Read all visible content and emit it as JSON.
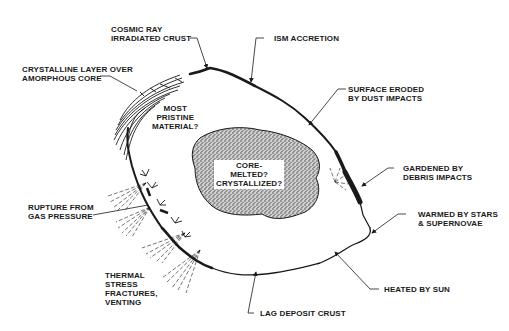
{
  "diagram": {
    "labels": {
      "cosmic_ray": [
        "COSMIC RAY",
        "IRRADIATED CRUST"
      ],
      "ism_accretion": [
        "ISM ACCRETION"
      ],
      "crystalline_layer": [
        "CRYSTALLINE LAYER OVER",
        "AMORPHOUS CORE"
      ],
      "surface_eroded": [
        "SURFACE ERODED",
        "BY DUST IMPACTS"
      ],
      "most_pristine": [
        "MOST",
        "PRISTINE",
        "MATERIAL?"
      ],
      "core": [
        "CORE-",
        "MELTED?",
        "CRYSTALLIZED?"
      ],
      "gardened": [
        "GARDENED BY",
        "DEBRIS IMPACTS"
      ],
      "rupture": [
        "RUPTURE FROM",
        "GAS PRESSURE"
      ],
      "warmed": [
        "WARMED BY STARS",
        "& SUPERNOVAE"
      ],
      "thermal": [
        "THERMAL",
        "STRESS",
        "FRACTURES,",
        "VENTING"
      ],
      "heated": [
        "HEATED BY SUN"
      ],
      "lag_deposit": [
        "LAG DEPOSIT CRUST"
      ]
    },
    "colors": {
      "ink": "#1a1a1a",
      "background": "#ffffff",
      "core_stipple": "#8a8a8a"
    }
  }
}
